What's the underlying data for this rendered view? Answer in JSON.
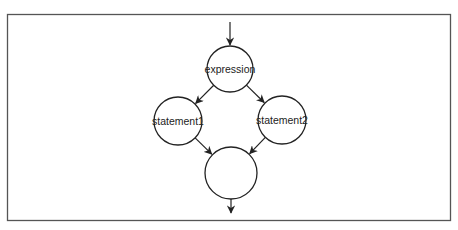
{
  "diagram": {
    "type": "flowchart",
    "nodes": [
      {
        "id": "expression",
        "label": "expression"
      },
      {
        "id": "statement1",
        "label": "statement1"
      },
      {
        "id": "statement2",
        "label": "statement2"
      },
      {
        "id": "join",
        "label": ""
      }
    ],
    "edges": [
      {
        "from": "entry",
        "to": "expression"
      },
      {
        "from": "expression",
        "to": "statement1"
      },
      {
        "from": "expression",
        "to": "statement2"
      },
      {
        "from": "statement1",
        "to": "join"
      },
      {
        "from": "statement2",
        "to": "join"
      },
      {
        "from": "join",
        "to": "exit"
      }
    ],
    "colors": {
      "stroke": "#222222",
      "frame": "#555555",
      "background": "#ffffff"
    }
  }
}
